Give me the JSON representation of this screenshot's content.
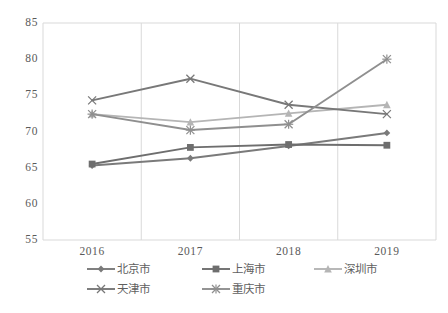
{
  "chart_data": {
    "type": "line",
    "title": "",
    "xlabel": "",
    "ylabel": "",
    "categories": [
      "2016",
      "2017",
      "2018",
      "2019"
    ],
    "ylim": [
      55,
      85
    ],
    "y_ticks": [
      "55",
      "60",
      "65",
      "70",
      "75",
      "80",
      "85"
    ],
    "grid": "vertical-only",
    "legend_position": "bottom",
    "series": [
      {
        "name": "北京市",
        "marker": "diamond",
        "color": "#7a7a7a",
        "values": [
          65.3,
          66.3,
          68.0,
          69.8
        ]
      },
      {
        "name": "上海市",
        "marker": "square",
        "color": "#6e6e6e",
        "values": [
          65.5,
          67.8,
          68.2,
          68.1
        ]
      },
      {
        "name": "深圳市",
        "marker": "triangle",
        "color": "#b5b5b5",
        "values": [
          72.4,
          71.3,
          72.5,
          73.7
        ]
      },
      {
        "name": "天津市",
        "marker": "cross",
        "color": "#787878",
        "values": [
          74.3,
          77.3,
          73.7,
          72.4
        ]
      },
      {
        "name": "重庆市",
        "marker": "asterisk",
        "color": "#8f8f8f",
        "values": [
          72.4,
          70.2,
          71.0,
          80.0
        ]
      }
    ]
  },
  "axis": {
    "y_labels": [
      "85",
      "80",
      "75",
      "70",
      "65",
      "60",
      "55"
    ],
    "x_labels": [
      "2016",
      "2017",
      "2018",
      "2019"
    ]
  },
  "legend": {
    "rows": [
      [
        {
          "label": "北京市",
          "marker": "diamond",
          "color": "#7a7a7a"
        },
        {
          "label": "上海市",
          "marker": "square",
          "color": "#6e6e6e"
        },
        {
          "label": "深圳市",
          "marker": "triangle",
          "color": "#b5b5b5"
        }
      ],
      [
        {
          "label": "天津市",
          "marker": "cross",
          "color": "#787878"
        },
        {
          "label": "重庆市",
          "marker": "asterisk",
          "color": "#8f8f8f"
        }
      ]
    ]
  },
  "colors": {
    "axis_line": "#d9d9d9",
    "gridline": "#d9d9d9",
    "text": "#595959",
    "background": "#ffffff"
  }
}
